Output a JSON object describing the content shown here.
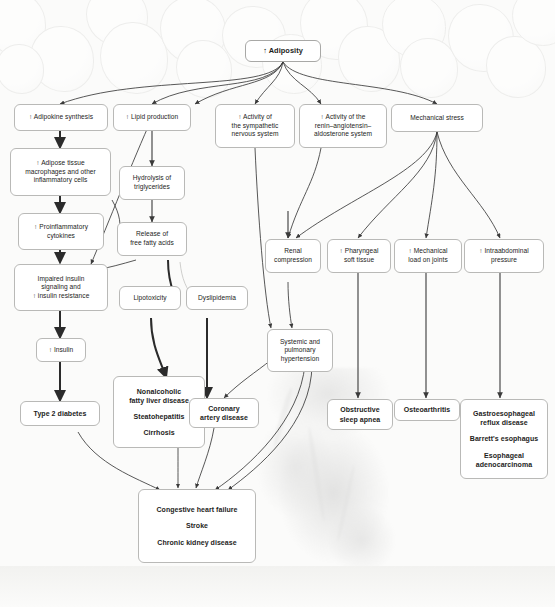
{
  "figure": {
    "type": "flow-diagram",
    "title_visible": false,
    "background_images": [
      "adipocytes-micrograph",
      "human-heart-photo"
    ],
    "arrow_symbol": "↑"
  },
  "nodes": {
    "adiposity": {
      "lines": [
        "↑ Adiposity"
      ]
    },
    "adipokine": {
      "lines": [
        "↑ Adipokine synthesis"
      ]
    },
    "adipose_tissue": {
      "lines": [
        "↑ Adipose tissue",
        "macrophages and other",
        "inflammatory cells"
      ]
    },
    "proinflammatory": {
      "lines": [
        "↑ Proinflammatory",
        "cytokines"
      ]
    },
    "impaired_insulin": {
      "lines": [
        "Impaired insulin",
        "signaling and",
        "↑ insulin resistance"
      ]
    },
    "insulin": {
      "lines": [
        "↑ Insulin"
      ]
    },
    "type2_diabetes": {
      "lines": [
        "Type 2 diabetes"
      ]
    },
    "lipid_production": {
      "lines": [
        "↑ Lipid production"
      ]
    },
    "hydrolysis": {
      "lines": [
        "Hydrolysis of",
        "triglycerides"
      ]
    },
    "free_fatty_acids": {
      "lines": [
        "Release of",
        "free fatty acids"
      ]
    },
    "lipotoxicity": {
      "lines": [
        "Lipotoxicity"
      ]
    },
    "dyslipidemia": {
      "lines": [
        "Dyslipidemia"
      ]
    },
    "nafld": {
      "lines": [
        "Nonalcoholic",
        "fatty liver disease"
      ],
      "lines2": [
        "Steatohepatitis"
      ],
      "lines3": [
        "Cirrhosis"
      ]
    },
    "coronary": {
      "lines": [
        "Coronary",
        "artery disease"
      ]
    },
    "sympathetic": {
      "lines": [
        "↑ Activity of",
        "the sympathetic",
        "nervous system"
      ]
    },
    "raas": {
      "lines": [
        "↑ Activity of the",
        "renin–angiotensin–",
        "aldosterone system"
      ]
    },
    "mechanical_stress": {
      "lines": [
        "Mechanical stress"
      ]
    },
    "renal_compression": {
      "lines": [
        "Renal",
        "compression"
      ]
    },
    "pharyngeal": {
      "lines": [
        "↑ Pharyngeal",
        "soft tissue"
      ]
    },
    "mechanical_load": {
      "lines": [
        "↑ Mechanical",
        "load on joints"
      ]
    },
    "intraabdominal": {
      "lines": [
        "↑ Intraabdominal",
        "pressure"
      ]
    },
    "hypertension": {
      "lines": [
        "Systemic and",
        "pulmonary",
        "hypertension"
      ]
    },
    "osa": {
      "lines": [
        "Obstructive",
        "sleep apnea"
      ]
    },
    "osteoarthritis": {
      "lines": [
        "Osteoarthritis"
      ]
    },
    "gerd": {
      "lines": [
        "Gastroesophageal",
        "reflux disease"
      ],
      "lines2": [
        "Barrett's esophagus"
      ],
      "lines3": [
        "Esophageal",
        "adenocarcinoma"
      ]
    },
    "final_outcomes": {
      "lines": [
        "Congestive heart failure"
      ],
      "lines2": [
        "Stroke"
      ],
      "lines3": [
        "Chronic kidney disease"
      ]
    }
  },
  "colors": {
    "node_fill": "#ffffff",
    "node_border": "#b9b9b7",
    "text": "#1d1d1b",
    "edge_thin": "#3a3a3a",
    "edge_thick": "#2b2b2b",
    "edge_light": "#bdbdbb",
    "page_background": "#fbfbfa"
  }
}
